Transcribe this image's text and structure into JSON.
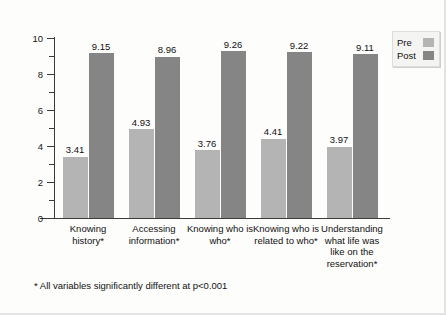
{
  "chart_data": {
    "type": "bar",
    "title": "",
    "subtitle": "",
    "xlabel": "",
    "ylabel": "",
    "ylim": [
      0,
      10
    ],
    "grid": false,
    "legend_position": "top-right",
    "categories": [
      "Knowing history*",
      "Accessing information*",
      "Knowing who is who*",
      "Knowing who is related to who*",
      "Understanding what life was like on the reservation*"
    ],
    "series": [
      {
        "name": "Pre",
        "color": "#b4b4b4",
        "values": [
          3.41,
          4.93,
          3.76,
          4.41,
          3.97
        ]
      },
      {
        "name": "Post",
        "color": "#858585",
        "values": [
          9.15,
          8.96,
          9.26,
          9.22,
          9.11
        ]
      }
    ],
    "y_ticks_major": [
      "0",
      "2",
      "4",
      "6",
      "8",
      "10"
    ],
    "y_ticks_minor": [
      1,
      3,
      5,
      7,
      9
    ],
    "annotations": [
      "* All variables significantly different at p<0.001"
    ]
  },
  "legend": {
    "items": [
      {
        "label": "Pre",
        "swatch": "pre-swatch"
      },
      {
        "label": "Post",
        "swatch": "post-swatch"
      }
    ]
  },
  "footnote": {
    "text": "* All variables significantly different at p<0.001"
  },
  "colors": {
    "pre": "#b4b4b4",
    "post": "#858585",
    "axis": "#3b3b3b",
    "text": "#111111",
    "page": "#fdfdfc"
  }
}
